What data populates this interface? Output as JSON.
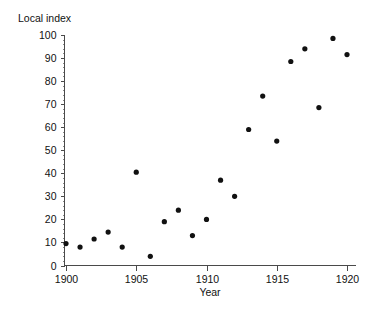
{
  "chart_data": {
    "type": "scatter",
    "title": "",
    "xlabel": "Year",
    "ylabel": "Local index",
    "xlim": [
      1899,
      1921
    ],
    "ylim": [
      0,
      100
    ],
    "grid": false,
    "legend": null,
    "x_ticks": [
      1900,
      1905,
      1910,
      1915,
      1920
    ],
    "x_tick_labels": [
      "1900",
      "1905",
      "1910",
      "1915",
      "1920"
    ],
    "x_minor_tick_step": 1,
    "y_ticks": [
      0,
      10,
      20,
      30,
      40,
      50,
      60,
      70,
      80,
      90,
      100
    ],
    "y_tick_labels": [
      "0",
      "10",
      "20",
      "30",
      "40",
      "50",
      "60",
      "70",
      "80",
      "90",
      "100"
    ],
    "y_minor_tick_step": 2,
    "marker": "filled-circle",
    "marker_color": "#111111",
    "x": [
      1900,
      1901,
      1902,
      1903,
      1904,
      1905,
      1906,
      1907,
      1908,
      1909,
      1910,
      1911,
      1912,
      1913,
      1914,
      1915,
      1916,
      1917,
      1918,
      1919,
      1920
    ],
    "values": [
      9.5,
      8.0,
      11.5,
      14.5,
      8.0,
      40.5,
      4.0,
      19.0,
      24.0,
      13.0,
      20.0,
      37.0,
      30.0,
      59.0,
      73.5,
      54.0,
      88.5,
      94.0,
      68.5,
      98.5,
      91.5
    ],
    "points": [
      {
        "year": 1900,
        "local_index": 9.5
      },
      {
        "year": 1901,
        "local_index": 8.0
      },
      {
        "year": 1902,
        "local_index": 11.5
      },
      {
        "year": 1903,
        "local_index": 14.5
      },
      {
        "year": 1904,
        "local_index": 8.0
      },
      {
        "year": 1905,
        "local_index": 40.5
      },
      {
        "year": 1906,
        "local_index": 4.0
      },
      {
        "year": 1907,
        "local_index": 19.0
      },
      {
        "year": 1908,
        "local_index": 24.0
      },
      {
        "year": 1909,
        "local_index": 13.0
      },
      {
        "year": 1910,
        "local_index": 20.0
      },
      {
        "year": 1911,
        "local_index": 37.0
      },
      {
        "year": 1912,
        "local_index": 30.0
      },
      {
        "year": 1913,
        "local_index": 59.0
      },
      {
        "year": 1914,
        "local_index": 73.5
      },
      {
        "year": 1915,
        "local_index": 54.0
      },
      {
        "year": 1916,
        "local_index": 88.5
      },
      {
        "year": 1917,
        "local_index": 94.0
      },
      {
        "year": 1918,
        "local_index": 68.5
      },
      {
        "year": 1919,
        "local_index": 98.5
      },
      {
        "year": 1920,
        "local_index": 91.5
      }
    ]
  },
  "colors": {
    "axis": "#4a4a4a",
    "text": "#111111",
    "marker": "#111111",
    "background": "#ffffff"
  }
}
